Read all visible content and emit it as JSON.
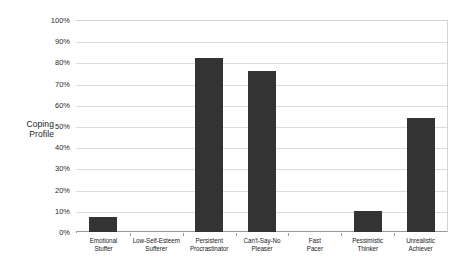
{
  "chart_data": {
    "type": "bar",
    "title": "",
    "subtitle": "",
    "xlabel": "",
    "ylabel": "Coping Profile",
    "ylabel_lines": [
      "Coping",
      "Profile"
    ],
    "ylim": [
      0,
      100
    ],
    "y_unit": "%",
    "grid": true,
    "legend": "none",
    "orientation": "vertical",
    "bar_color": "#333333",
    "gridline_color": "#dcdcdc",
    "axis_color": "#9a9a9a",
    "background_color": "#ffffff",
    "y_ticks": [
      "0%",
      "10%",
      "20%",
      "30%",
      "40%",
      "50%",
      "60%",
      "70%",
      "80%",
      "90%",
      "100%"
    ],
    "y_tick_values": [
      0,
      10,
      20,
      30,
      40,
      50,
      60,
      70,
      80,
      90,
      100
    ],
    "categories": [
      "Emotional Stuffer",
      "Low-Self-Esteem Sufferer",
      "Persistent Procrastinator",
      "Can't-Say-No Pleaser",
      "Fast Pacer",
      "Pessimistic Thinker",
      "Unrealistic Achiever"
    ],
    "category_lines": [
      [
        "Emotional",
        "Stuffer"
      ],
      [
        "Low-Self-Esteem",
        "Sufferer"
      ],
      [
        "Persistent",
        "Procrastinator"
      ],
      [
        "Can't-Say-No",
        "Pleaser"
      ],
      [
        "Fast",
        "Pacer"
      ],
      [
        "Pessimistic",
        "Thinker"
      ],
      [
        "Unrealistic",
        "Achiever"
      ]
    ],
    "values": [
      7,
      0,
      82,
      76,
      0,
      10,
      54
    ]
  }
}
